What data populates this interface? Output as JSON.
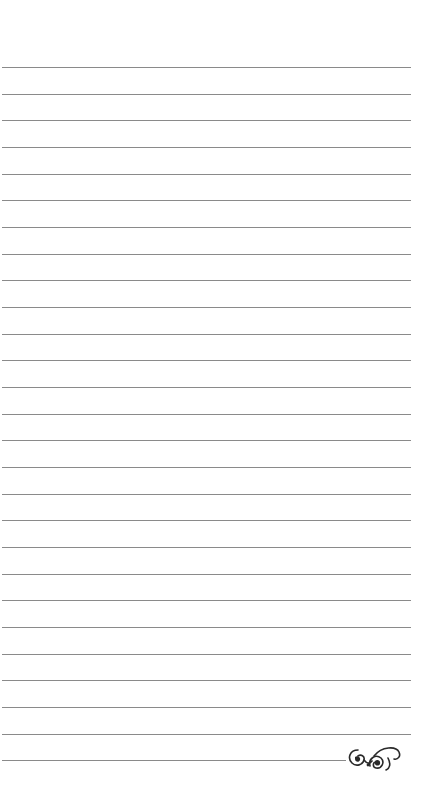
{
  "page": {
    "type": "lined-notepaper",
    "background_color": "#ffffff",
    "line_color": "#8a8a8a",
    "first_line_y": 67,
    "line_spacing": 26.67,
    "line_left": 2,
    "line_right": 411,
    "full_line_count": 26,
    "last_line": {
      "y": 760,
      "right": 346
    }
  },
  "ornament": {
    "icon": "flourish-ornament-icon",
    "color": "#2a2a2a"
  }
}
